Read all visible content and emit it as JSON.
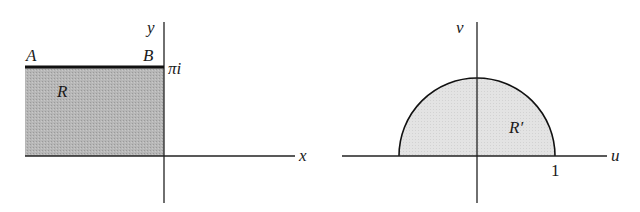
{
  "figure": {
    "left_panel": {
      "axes": {
        "horizontal_label": "x",
        "vertical_label": "y"
      },
      "region_label": "R",
      "corner_labels": {
        "top_left": "A",
        "top_right": "B"
      },
      "height_label": "πi",
      "colors": {
        "region_fill": "#b4b4b4",
        "boundary": "#111111",
        "axis": "#222222"
      }
    },
    "right_panel": {
      "axes": {
        "horizontal_label": "u",
        "vertical_label": "v"
      },
      "region_label": "R′",
      "tick_label": "1",
      "colors": {
        "region_fill": "#e2e2e2",
        "boundary": "#111111",
        "axis": "#222222"
      }
    }
  }
}
